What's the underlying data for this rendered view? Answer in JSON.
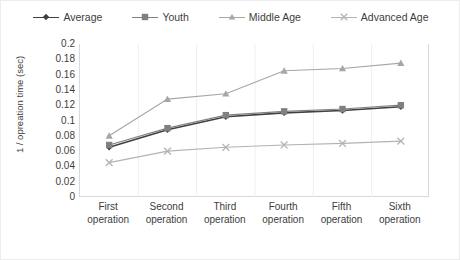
{
  "chart_data": {
    "type": "line",
    "title": "",
    "xlabel": "",
    "ylabel": "1 / opreation time (sec)",
    "categories": [
      "First operation",
      "Second operation",
      "Third operation",
      "Fourth operation",
      "Fifth operation",
      "Sixth operation"
    ],
    "category_lines": [
      [
        "First",
        "operation"
      ],
      [
        "Second",
        "operation"
      ],
      [
        "Third",
        "operation"
      ],
      [
        "Fourth",
        "operation"
      ],
      [
        "Fifth",
        "operation"
      ],
      [
        "Sixth",
        "operation"
      ]
    ],
    "ylim": [
      0,
      0.2
    ],
    "yticks": [
      0,
      0.02,
      0.04,
      0.06,
      0.08,
      0.1,
      0.12,
      0.14,
      0.16,
      0.18,
      0.2
    ],
    "ytick_labels": [
      "0",
      "0.02",
      "0.04",
      "0.06",
      "0.08",
      "0.1",
      "0.12",
      "0.14",
      "0.16",
      "0.18",
      "0.2"
    ],
    "grid": {
      "vertical": true,
      "horizontal": false
    },
    "legend_position": "top-center",
    "series": [
      {
        "name": "Average",
        "marker": "diamond",
        "color": "#404040",
        "values": [
          0.065,
          0.088,
          0.105,
          0.11,
          0.113,
          0.118
        ]
      },
      {
        "name": "Youth",
        "marker": "square",
        "color": "#808080",
        "values": [
          0.068,
          0.09,
          0.107,
          0.112,
          0.115,
          0.12
        ]
      },
      {
        "name": "Middle Age",
        "marker": "triangle",
        "color": "#a6a6a6",
        "values": [
          0.08,
          0.128,
          0.135,
          0.165,
          0.168,
          0.175
        ]
      },
      {
        "name": "Advanced Age",
        "marker": "cross",
        "color": "#b3b3b3",
        "values": [
          0.045,
          0.06,
          0.065,
          0.068,
          0.07,
          0.073
        ]
      }
    ]
  }
}
